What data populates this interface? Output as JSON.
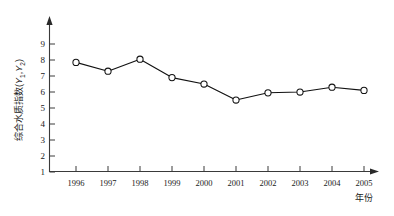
{
  "chart_data": {
    "type": "line",
    "title": "",
    "xlabel": "年份",
    "ylabel": "综合水质指数(Y1,Y2)",
    "ylabel_main": "综合水质指数",
    "ylabel_paren_open": "(",
    "ylabel_y1": "Y",
    "ylabel_y1_sub": "1",
    "ylabel_comma": ",",
    "ylabel_y2": "Y",
    "ylabel_y2_sub": "2",
    "ylabel_paren_close": ")",
    "categories": [
      "1996",
      "1997",
      "1998",
      "1999",
      "2000",
      "2001",
      "2002",
      "2003",
      "2004",
      "2005"
    ],
    "values": [
      7.85,
      7.3,
      8.05,
      6.9,
      6.5,
      5.5,
      5.95,
      6.0,
      6.3,
      6.1
    ],
    "ylim": [
      1,
      9
    ],
    "yticks": [
      "1",
      "2",
      "3",
      "4",
      "5",
      "6",
      "7",
      "8",
      "9"
    ],
    "ytick_values": [
      1,
      2,
      3,
      4,
      5,
      6,
      7,
      8,
      9
    ],
    "grid": false,
    "legend": "none",
    "marker": "open-circle",
    "series": [
      {
        "name": "综合水质指数",
        "values": [
          7.85,
          7.3,
          8.05,
          6.9,
          6.5,
          5.5,
          5.95,
          6.0,
          6.3,
          6.1
        ]
      }
    ]
  }
}
